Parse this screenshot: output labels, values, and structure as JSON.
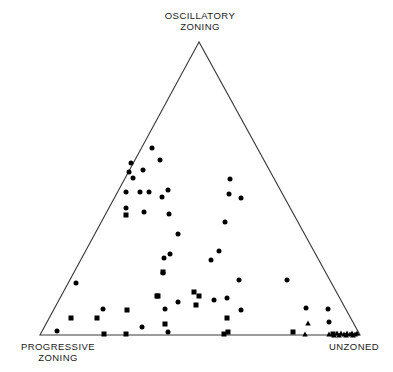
{
  "figure": {
    "kind": "ternary-scatter-diagram",
    "background_color": "#ffffff",
    "line_color": "#3a3a3a",
    "marker_color": "#000000"
  },
  "labels": {
    "top": "OSCILLATORY\nZONING",
    "left": "PROGRESSIVE\nZONING",
    "right": "UNZONED"
  },
  "chart_data": {
    "type": "scatter",
    "title": "",
    "subtitle": "",
    "xlabel": "",
    "ylabel": "",
    "grid": false,
    "legend_position": "none",
    "projection": "ternary",
    "axes": {
      "top_vertex_label": "OSCILLATORY ZONING",
      "left_vertex_label": "PROGRESSIVE ZONING",
      "right_vertex_label": "UNZONED",
      "triangle_pixels": {
        "apex": [
          199,
          42
        ],
        "left": [
          40,
          335
        ],
        "right": [
          360,
          335
        ]
      },
      "value_range": [
        0,
        100
      ]
    },
    "series": [
      {
        "name": "circle-samples",
        "marker": "circle",
        "marker_size_px": 5.0,
        "color": "#000000",
        "points_px": [
          [
            152,
            148
          ],
          [
            160,
            160
          ],
          [
            131,
            163
          ],
          [
            143,
            170
          ],
          [
            129,
            172
          ],
          [
            133,
            178
          ],
          [
            168,
            190
          ],
          [
            126,
            192
          ],
          [
            140,
            192
          ],
          [
            149,
            192
          ],
          [
            162,
            197
          ],
          [
            230,
            179
          ],
          [
            229,
            194
          ],
          [
            241,
            198
          ],
          [
            126,
            208
          ],
          [
            144,
            212
          ],
          [
            169,
            214
          ],
          [
            225,
            222
          ],
          [
            178,
            234
          ],
          [
            170,
            254
          ],
          [
            219,
            251
          ],
          [
            211,
            260
          ],
          [
            164,
            258
          ],
          [
            163,
            273
          ],
          [
            76,
            283
          ],
          [
            239,
            280
          ],
          [
            287,
            280
          ],
          [
            103,
            309
          ],
          [
            227,
            298
          ],
          [
            165,
            309
          ],
          [
            178,
            302
          ],
          [
            214,
            300
          ],
          [
            241,
            310
          ],
          [
            306,
            308
          ],
          [
            328,
            309
          ],
          [
            329,
            322
          ],
          [
            57,
            331
          ],
          [
            142,
            327
          ],
          [
            168,
            332
          ]
        ]
      },
      {
        "name": "square-samples",
        "marker": "square",
        "marker_size_px": 5.0,
        "color": "#000000",
        "points_px": [
          [
            126,
            215
          ],
          [
            163,
            272
          ],
          [
            158,
            296
          ],
          [
            194,
            292
          ],
          [
            199,
            296
          ],
          [
            71,
            318
          ],
          [
            97,
            318
          ],
          [
            127,
            310
          ],
          [
            157,
            296
          ],
          [
            196,
            305
          ],
          [
            227,
            318
          ],
          [
            104,
            334
          ],
          [
            126,
            334
          ],
          [
            165,
            324
          ],
          [
            224,
            334
          ],
          [
            228,
            332
          ],
          [
            293,
            332
          ],
          [
            333,
            334
          ]
        ]
      },
      {
        "name": "triangle-samples",
        "marker": "triangle",
        "marker_size_px": 5.5,
        "color": "#000000",
        "points_px": [
          [
            308,
            323
          ],
          [
            305,
            334
          ],
          [
            329,
            334
          ],
          [
            337,
            333
          ],
          [
            341,
            333
          ],
          [
            344,
            334
          ],
          [
            347,
            333
          ],
          [
            350,
            334
          ],
          [
            352,
            333
          ],
          [
            355,
            334
          ],
          [
            357,
            333
          ],
          [
            334,
            335
          ],
          [
            339,
            335
          ],
          [
            346,
            335
          ],
          [
            353,
            335
          ]
        ]
      }
    ]
  }
}
